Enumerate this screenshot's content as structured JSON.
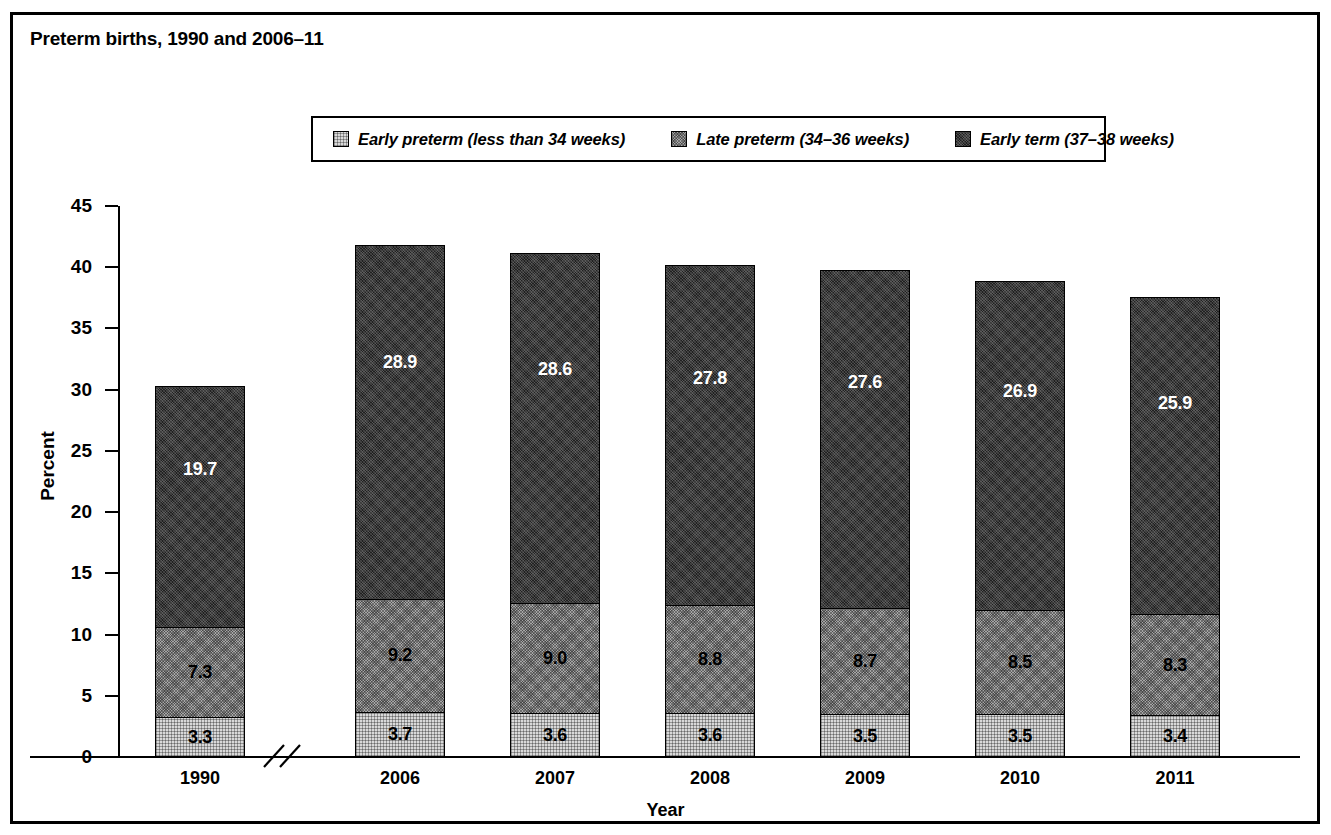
{
  "title": "Preterm births, 1990 and 2006–11",
  "legend": {
    "entries": [
      {
        "label": "Early preterm (less than 34 weeks)",
        "swatch": "light-gray-dither",
        "color": "#d9d9d9"
      },
      {
        "label": "Late preterm (34–36 weeks)",
        "swatch": "medium-gray-dither",
        "color": "#a6a6a6"
      },
      {
        "label": "Early term (37–38 weeks)",
        "swatch": "dark-gray-dither",
        "color": "#3b3b3b"
      }
    ]
  },
  "axes": {
    "y_title": "Percent",
    "x_title": "Year",
    "y_ticks": [
      "0",
      "5",
      "10",
      "15",
      "20",
      "25",
      "30",
      "35",
      "40",
      "45"
    ],
    "x_ticks": [
      "1990",
      "2006",
      "2007",
      "2008",
      "2009",
      "2010",
      "2011"
    ],
    "axis_break_note": "break-between-1990-and-2006"
  },
  "chart_data": {
    "type": "bar",
    "subtype": "stacked-vertical",
    "title": "Preterm births, 1990 and 2006–11",
    "xlabel": "Year",
    "ylabel": "Percent",
    "ylim": [
      0,
      45
    ],
    "ytick_step": 5,
    "grid": false,
    "legend_position": "top-center",
    "axis_break": true,
    "categories": [
      "1990",
      "2006",
      "2007",
      "2008",
      "2009",
      "2010",
      "2011"
    ],
    "series": [
      {
        "name": "Early preterm (less than 34 weeks)",
        "color": "#d9d9d9",
        "values": [
          3.3,
          3.7,
          3.6,
          3.6,
          3.5,
          3.5,
          3.4
        ],
        "labels": [
          "3.3",
          "3.7",
          "3.6",
          "3.6",
          "3.5",
          "3.5",
          "3.4"
        ]
      },
      {
        "name": "Late preterm (34–36 weeks)",
        "color": "#a6a6a6",
        "values": [
          7.3,
          9.2,
          9.0,
          8.8,
          8.7,
          8.5,
          8.3
        ],
        "labels": [
          "7.3",
          "9.2",
          "9.0",
          "8.8",
          "8.7",
          "8.5",
          "8.3"
        ]
      },
      {
        "name": "Early term (37–38 weeks)",
        "color": "#3b3b3b",
        "values": [
          19.7,
          28.9,
          28.6,
          27.8,
          27.6,
          26.9,
          25.9
        ],
        "labels": [
          "19.7",
          "28.9",
          "28.6",
          "27.8",
          "27.6",
          "26.9",
          "25.9"
        ]
      }
    ],
    "totals": [
      30.3,
      41.8,
      41.2,
      40.2,
      39.8,
      38.9,
      37.6
    ]
  }
}
